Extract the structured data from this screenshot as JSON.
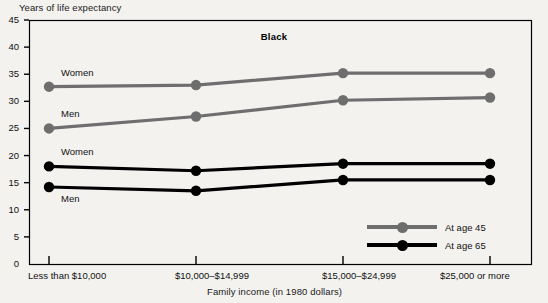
{
  "chart_data": {
    "type": "line",
    "title": "Black",
    "ylabel": "Years of life expectancy",
    "xlabel": "Family income (in 1980 dollars)",
    "categories": [
      "Less than $10,000",
      "$10,000–$14,999",
      "$15,000–$24,999",
      "$25,000 or more"
    ],
    "ylim": [
      0,
      45
    ],
    "yticks": [
      0,
      5,
      10,
      15,
      20,
      25,
      30,
      35,
      40,
      45
    ],
    "grid": false,
    "legend_position": "inside-bottom-right",
    "series": [
      {
        "name": "Women, at age 45",
        "group": "At age 45",
        "sex": "Women",
        "color": "#6e6e6e",
        "values": [
          32.7,
          33.0,
          35.2,
          35.2
        ]
      },
      {
        "name": "Men, at age 45",
        "group": "At age 45",
        "sex": "Men",
        "color": "#6e6e6e",
        "values": [
          25.0,
          27.2,
          30.2,
          30.7
        ]
      },
      {
        "name": "Women, at age 65",
        "group": "At age 65",
        "sex": "Women",
        "color": "#000000",
        "values": [
          18.0,
          17.2,
          18.5,
          18.5
        ]
      },
      {
        "name": "Men, at age 65",
        "group": "At age 65",
        "sex": "Men",
        "color": "#000000",
        "values": [
          14.2,
          13.5,
          15.5,
          15.5
        ]
      }
    ],
    "annotations": [
      {
        "text": "Women",
        "series": 0
      },
      {
        "text": "Men",
        "series": 1
      },
      {
        "text": "Women",
        "series": 2
      },
      {
        "text": "Men",
        "series": 3
      }
    ],
    "legend": [
      {
        "label": "At age 45",
        "color": "#6e6e6e"
      },
      {
        "label": "At age 65",
        "color": "#000000"
      }
    ]
  },
  "colors": {
    "age45": "#6e6e6e",
    "age65": "#000000",
    "axis": "#000000",
    "background": "#f3f2ef"
  }
}
